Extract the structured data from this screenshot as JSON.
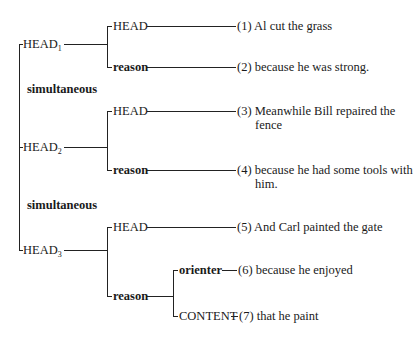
{
  "diagram": {
    "heads": [
      {
        "label": "HEAD",
        "subscript": "1",
        "branches": [
          {
            "label": "HEAD",
            "bold": false,
            "leaf": "(1) Al cut the grass"
          },
          {
            "label": "reason",
            "bold": true,
            "leaf": "(2) because he was strong."
          }
        ]
      },
      {
        "label": "HEAD",
        "subscript": "2",
        "branches": [
          {
            "label": "HEAD",
            "bold": false,
            "leaf": "(3) Meanwhile Bill repaired the",
            "leaf_cont": "fence"
          },
          {
            "label": "reason",
            "bold": true,
            "leaf": "(4) because he had some tools with",
            "leaf_cont": "him."
          }
        ]
      },
      {
        "label": "HEAD",
        "subscript": "3",
        "branches": [
          {
            "label": "HEAD",
            "bold": false,
            "leaf": "(5) And Carl painted the gate"
          },
          {
            "label": "reason",
            "bold": true,
            "children": [
              {
                "label": "orienter",
                "bold": true,
                "leaf": "(6) because he enjoyed"
              },
              {
                "label": "CONTENT",
                "bold": false,
                "leaf": "(7) that he paint"
              }
            ]
          }
        ]
      }
    ],
    "relations": [
      "simultaneous",
      "simultaneous"
    ]
  }
}
